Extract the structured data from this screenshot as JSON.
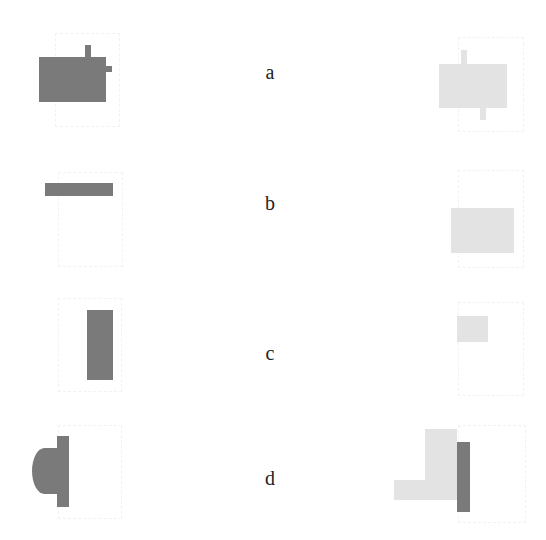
{
  "figure": {
    "colors": {
      "dark": "#7a7a7a",
      "light": "#e3e3e3",
      "background": "#ffffff"
    },
    "panels": [
      {
        "id": "a",
        "label": "a",
        "left": {
          "color": "dark",
          "description": "large rectangle with small tab on top and small tab on right"
        },
        "right": {
          "color": "light",
          "description": "large rectangle with small tab on top-left and small tab on bottom-right"
        }
      },
      {
        "id": "b",
        "label": "b",
        "left": {
          "color": "dark",
          "description": "thin horizontal bar"
        },
        "right": {
          "color": "light",
          "description": "medium rectangle"
        }
      },
      {
        "id": "c",
        "label": "c",
        "left": {
          "color": "dark",
          "description": "tall vertical rectangle"
        },
        "right": {
          "color": "light",
          "description": "small rectangle"
        }
      },
      {
        "id": "d",
        "label": "d",
        "left": {
          "color": "dark",
          "description": "vertical bar with half-ellipse attached on the left"
        },
        "right": {
          "color": "mixed",
          "description": "light L-shape with dark vertical bar on the right"
        }
      }
    ]
  }
}
